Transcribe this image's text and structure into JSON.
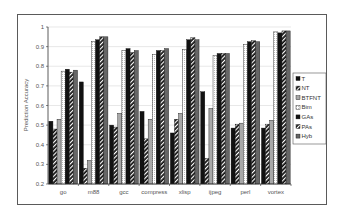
{
  "chart_data": {
    "type": "bar",
    "title": "",
    "xlabel": "",
    "ylabel": "Prediction Accuracy",
    "ylim": [
      0.2,
      1.0
    ],
    "yticks": [
      0.2,
      0.3,
      0.4,
      0.5,
      0.6,
      0.7,
      0.8,
      0.9,
      1
    ],
    "ytick_labels": [
      "0.2",
      "0.3",
      "0.4",
      "0.5",
      "0.6",
      "0.7",
      "0.8",
      "0.9",
      "1"
    ],
    "grid": true,
    "legend_position": "right",
    "categories": [
      "go",
      "m88",
      "gcc",
      "compress",
      "xlisp",
      "ijpeg",
      "perl",
      "vortex"
    ],
    "series": [
      {
        "name": "T",
        "pattern": "solid-black",
        "values": [
          0.52,
          0.72,
          0.5,
          0.57,
          0.46,
          0.67,
          0.485,
          0.485
        ]
      },
      {
        "name": "NT",
        "pattern": "diagonal-hatch",
        "values": [
          0.48,
          0.28,
          0.49,
          0.43,
          0.53,
          0.33,
          0.505,
          0.505
        ]
      },
      {
        "name": "BTFNT",
        "pattern": "light-gray",
        "values": [
          0.53,
          0.32,
          0.56,
          0.53,
          0.56,
          0.585,
          0.51,
          0.525
        ]
      },
      {
        "name": "Bim",
        "pattern": "dotted-light",
        "values": [
          0.775,
          0.925,
          0.88,
          0.86,
          0.885,
          0.855,
          0.91,
          0.975
        ]
      },
      {
        "name": "GAs",
        "pattern": "solid-black",
        "values": [
          0.785,
          0.935,
          0.89,
          0.88,
          0.935,
          0.865,
          0.925,
          0.97
        ]
      },
      {
        "name": "PAs",
        "pattern": "diagonal-hatch",
        "values": [
          0.77,
          0.95,
          0.87,
          0.88,
          0.945,
          0.865,
          0.93,
          0.98
        ]
      },
      {
        "name": "Hyb",
        "pattern": "dark-gray",
        "values": [
          0.78,
          0.95,
          0.88,
          0.89,
          0.935,
          0.865,
          0.925,
          0.98
        ]
      }
    ]
  },
  "colors": {
    "frame": "#5a5a5a",
    "axis": "#333333",
    "grid": "#d9d9d9",
    "solid": "#111111",
    "light_gray": "#a8a8a8",
    "dark_gray": "#666666",
    "dotted_bg": "#ffffff"
  }
}
